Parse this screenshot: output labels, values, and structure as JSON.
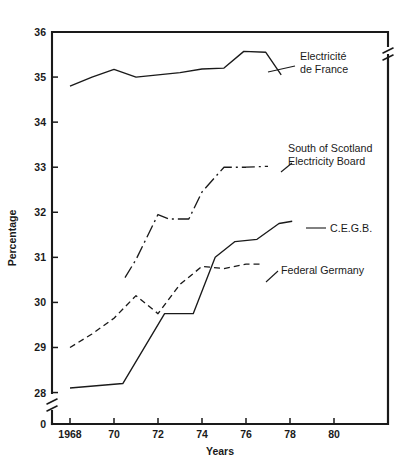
{
  "chart_data": {
    "type": "line",
    "title": "",
    "xlabel": "Years",
    "ylabel": "Percentage",
    "xlim": [
      1967.1,
      1981.6
    ],
    "ylim": [
      27.85,
      36.0
    ],
    "grid": false,
    "legend_position": "inline-annotations",
    "y_axis_break": true,
    "y_break_label": "0",
    "x_tick_labels": [
      "1968",
      "70",
      "72",
      "74",
      "76",
      "78",
      "80"
    ],
    "x_tick_values": [
      1968,
      1970,
      1972,
      1974,
      1976,
      1978,
      1980
    ],
    "y_tick_labels": [
      "28",
      "29",
      "30",
      "31",
      "32",
      "33",
      "34",
      "35",
      "36"
    ],
    "y_tick_values": [
      28,
      29,
      30,
      31,
      32,
      33,
      34,
      35,
      36
    ],
    "series": [
      {
        "name": "Electricité de France",
        "style": "solid",
        "label_lines": [
          "Electricité",
          "de France"
        ],
        "x": [
          1968.0,
          1969.0,
          1970.0,
          1971.0,
          1972.0,
          1973.0,
          1974.0,
          1975.0,
          1975.9,
          1976.9,
          1977.6
        ],
        "values": [
          34.8,
          35.0,
          35.17,
          35.0,
          35.05,
          35.1,
          35.18,
          35.2,
          35.57,
          35.55,
          35.05
        ]
      },
      {
        "name": "South of Scotland Electricity Board",
        "style": "dashdot",
        "label_lines": [
          "South of Scotland",
          "Electricity Board"
        ],
        "x": [
          1970.5,
          1971.0,
          1972.0,
          1972.5,
          1973.4,
          1974.0,
          1975.0,
          1976.0,
          1977.0
        ],
        "values": [
          30.55,
          30.95,
          31.95,
          31.85,
          31.85,
          32.45,
          33.0,
          33.0,
          33.02
        ]
      },
      {
        "name": "C.E.G.B.",
        "style": "solid",
        "label_lines": [
          "C.E.G.B."
        ],
        "x": [
          1968.0,
          1970.4,
          1972.3,
          1973.6,
          1974.6,
          1975.5,
          1976.5,
          1977.5,
          1978.1
        ],
        "values": [
          28.1,
          28.2,
          29.75,
          29.75,
          31.0,
          31.35,
          31.4,
          31.75,
          31.8
        ]
      },
      {
        "name": "Federal Germany",
        "style": "dashed",
        "label_lines": [
          "Federal Germany"
        ],
        "x": [
          1968.0,
          1969.0,
          1970.0,
          1971.0,
          1972.0,
          1973.0,
          1974.0,
          1975.0,
          1976.0,
          1976.7
        ],
        "values": [
          29.0,
          29.3,
          29.65,
          30.15,
          29.75,
          30.4,
          30.8,
          30.75,
          30.85,
          30.85
        ]
      }
    ],
    "annotations": [
      {
        "name": "electricite-de-france",
        "lines": [
          "Electricité",
          "de France"
        ],
        "text_x": 300,
        "text_y": 60,
        "leader": [
          [
            268,
            72
          ],
          [
            295,
            66
          ]
        ]
      },
      {
        "name": "south-of-scotland-electricity-board",
        "lines": [
          "South of Scotland",
          "Electricity Board"
        ],
        "text_x": 288,
        "text_y": 152,
        "leader": [
          [
            281,
            172
          ],
          [
            292,
            163
          ]
        ]
      },
      {
        "name": "cegb",
        "lines": [
          "C.E.G.B."
        ],
        "text_x": 330,
        "text_y": 232,
        "leader": [
          [
            306,
            228
          ],
          [
            326,
            228
          ]
        ]
      },
      {
        "name": "federal-germany",
        "lines": [
          "Federal Germany"
        ],
        "text_x": 281,
        "text_y": 274,
        "leader": [
          [
            266,
            282
          ],
          [
            278,
            271
          ]
        ]
      }
    ]
  }
}
